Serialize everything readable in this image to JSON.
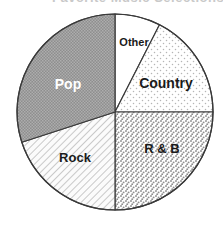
{
  "title": {
    "text": "Favorite Music Selections",
    "visible_fragment": true
  },
  "chart_data": {
    "type": "pie",
    "title": "Favorite Music Selections",
    "xlabel": "",
    "ylabel": "",
    "legend_position": "none",
    "labels_inside_slices": true,
    "grid": false,
    "center": {
      "x": 115,
      "y": 112
    },
    "radius": 98,
    "start_angle_deg": 0,
    "direction": "clockwise",
    "categories": [
      "Other",
      "Country",
      "R & B",
      "Rock",
      "Pop"
    ],
    "values": [
      7.5,
      17.5,
      25,
      20,
      30
    ],
    "unit": "percent",
    "slices": [
      {
        "label": "Other",
        "value": 7.5,
        "start_deg": 0,
        "end_deg": 27,
        "fill": "#ffffff",
        "pattern": "none",
        "text_color": "#1a1a1a",
        "label_x": 134,
        "label_y": 43,
        "label_font_size": 11
      },
      {
        "label": "Country",
        "value": 17.5,
        "start_deg": 27,
        "end_deg": 90,
        "fill": "#fbfbfb",
        "pattern": "sparse-dots",
        "text_color": "#1a1a1a",
        "label_x": 166,
        "label_y": 84,
        "label_font_size": 14
      },
      {
        "label": "R & B",
        "value": 25,
        "start_deg": 90,
        "end_deg": 180,
        "fill": "#f7f7f7",
        "pattern": "stipple",
        "text_color": "#1a1a1a",
        "label_x": 162,
        "label_y": 150,
        "label_font_size": 13
      },
      {
        "label": "Rock",
        "value": 20,
        "start_deg": 180,
        "end_deg": 252,
        "fill": "#f2f2f2",
        "pattern": "diagonal-hatch",
        "text_color": "#1a1a1a",
        "label_x": 75,
        "label_y": 159,
        "label_font_size": 13
      },
      {
        "label": "Pop",
        "value": 30,
        "start_deg": 252,
        "end_deg": 360,
        "fill": "#9a9a9a",
        "pattern": "fine-dot-dark",
        "text_color": "#ffffff",
        "label_x": 68,
        "label_y": 85,
        "label_font_size": 14
      }
    ],
    "outline_color": "#3a3a3a",
    "outline_width": 1.2
  }
}
